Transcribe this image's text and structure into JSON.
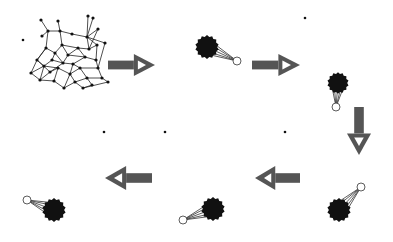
{
  "diagram": {
    "type": "process-flow",
    "colors": {
      "background": "#ffffff",
      "node": "#111111",
      "edge": "#222222",
      "arrow": "#555555",
      "arrow_inner": "#ffffff",
      "highlight_node_fill": "#ffffff",
      "highlight_node_stroke": "#333333"
    },
    "flow_order": [
      "network",
      "arrow-right-1",
      "stage-1",
      "arrow-right-2",
      "stage-2",
      "arrow-down",
      "stage-3",
      "arrow-left-1",
      "stage-4",
      "arrow-left-2",
      "stage-5"
    ],
    "stages": [
      {
        "id": "stage-1",
        "cluster": {
          "cx": 207,
          "cy": 47,
          "r": 11
        },
        "outlier": {
          "cx": 237,
          "cy": 61,
          "r": 4
        }
      },
      {
        "id": "stage-2",
        "cluster": {
          "cx": 338,
          "cy": 83,
          "r": 10
        },
        "outlier": {
          "cx": 336,
          "cy": 107,
          "r": 4
        }
      },
      {
        "id": "stage-3",
        "cluster": {
          "cx": 339,
          "cy": 210,
          "r": 11
        },
        "outlier": {
          "cx": 361,
          "cy": 187,
          "r": 4
        }
      },
      {
        "id": "stage-4",
        "cluster": {
          "cx": 213,
          "cy": 209,
          "r": 11
        },
        "outlier": {
          "cx": 183,
          "cy": 220,
          "r": 4
        }
      },
      {
        "id": "stage-5",
        "cluster": {
          "cx": 54,
          "cy": 210,
          "r": 11
        },
        "outlier": {
          "cx": 27,
          "cy": 200,
          "r": 4
        }
      }
    ],
    "arrows": [
      {
        "id": "arrow-right-1",
        "direction": "right",
        "x": 108,
        "y": 54,
        "w": 47,
        "h": 22
      },
      {
        "id": "arrow-right-2",
        "direction": "right",
        "x": 252,
        "y": 54,
        "w": 48,
        "h": 22
      },
      {
        "id": "arrow-down",
        "direction": "down",
        "x": 347,
        "y": 107,
        "w": 24,
        "h": 48
      },
      {
        "id": "arrow-left-1",
        "direction": "left",
        "x": 255,
        "y": 166,
        "w": 45,
        "h": 24
      },
      {
        "id": "arrow-left-2",
        "direction": "left",
        "x": 105,
        "y": 166,
        "w": 47,
        "h": 24
      }
    ],
    "isolated_dots": [
      {
        "cx": 23,
        "cy": 40
      },
      {
        "cx": 305,
        "cy": 18
      },
      {
        "cx": 104,
        "cy": 132
      },
      {
        "cx": 165,
        "cy": 132
      },
      {
        "cx": 285,
        "cy": 132
      }
    ],
    "network": {
      "nodes": [
        [
          41,
          20
        ],
        [
          58,
          21
        ],
        [
          88,
          16
        ],
        [
          93,
          18
        ],
        [
          98,
          29
        ],
        [
          42,
          36
        ],
        [
          48,
          31
        ],
        [
          60,
          31
        ],
        [
          72,
          34
        ],
        [
          87,
          37
        ],
        [
          105,
          43
        ],
        [
          97,
          45
        ],
        [
          37,
          60
        ],
        [
          31,
          73
        ],
        [
          40,
          80
        ],
        [
          50,
          72
        ],
        [
          63,
          63
        ],
        [
          73,
          64
        ],
        [
          85,
          57
        ],
        [
          96,
          60
        ],
        [
          98,
          68
        ],
        [
          102,
          78
        ],
        [
          108,
          82
        ],
        [
          55,
          53
        ],
        [
          46,
          48
        ],
        [
          62,
          45
        ],
        [
          78,
          48
        ],
        [
          89,
          49
        ],
        [
          54,
          81
        ],
        [
          64,
          88
        ],
        [
          75,
          82
        ],
        [
          87,
          78
        ],
        [
          92,
          85
        ],
        [
          83,
          88
        ],
        [
          70,
          74
        ],
        [
          58,
          68
        ],
        [
          44,
          66
        ],
        [
          52,
          60
        ],
        [
          80,
          68
        ],
        [
          68,
          55
        ]
      ],
      "edges": [
        [
          0,
          6
        ],
        [
          1,
          7
        ],
        [
          6,
          7
        ],
        [
          7,
          8
        ],
        [
          8,
          9
        ],
        [
          2,
          9
        ],
        [
          3,
          9
        ],
        [
          4,
          9
        ],
        [
          9,
          10
        ],
        [
          9,
          11
        ],
        [
          5,
          6
        ],
        [
          6,
          24
        ],
        [
          7,
          25
        ],
        [
          24,
          23
        ],
        [
          23,
          25
        ],
        [
          25,
          26
        ],
        [
          26,
          27
        ],
        [
          27,
          9
        ],
        [
          27,
          11
        ],
        [
          11,
          19
        ],
        [
          19,
          20
        ],
        [
          20,
          21
        ],
        [
          21,
          22
        ],
        [
          18,
          19
        ],
        [
          18,
          26
        ],
        [
          17,
          18
        ],
        [
          16,
          17
        ],
        [
          16,
          23
        ],
        [
          15,
          16
        ],
        [
          12,
          15
        ],
        [
          12,
          13
        ],
        [
          13,
          14
        ],
        [
          14,
          15
        ],
        [
          14,
          28
        ],
        [
          28,
          29
        ],
        [
          29,
          30
        ],
        [
          30,
          31
        ],
        [
          31,
          32
        ],
        [
          32,
          33
        ],
        [
          33,
          30
        ],
        [
          31,
          21
        ],
        [
          30,
          34
        ],
        [
          34,
          17
        ],
        [
          34,
          35
        ],
        [
          35,
          36
        ],
        [
          36,
          37
        ],
        [
          37,
          16
        ],
        [
          37,
          23
        ],
        [
          12,
          24
        ],
        [
          36,
          14
        ],
        [
          38,
          17
        ],
        [
          38,
          20
        ],
        [
          38,
          31
        ],
        [
          39,
          18
        ],
        [
          39,
          16
        ],
        [
          39,
          25
        ],
        [
          35,
          28
        ],
        [
          33,
          22
        ],
        [
          36,
          12
        ],
        [
          4,
          27
        ],
        [
          26,
          39
        ],
        [
          13,
          36
        ],
        [
          29,
          34
        ],
        [
          10,
          20
        ],
        [
          24,
          12
        ],
        [
          38,
          34
        ],
        [
          15,
          35
        ],
        [
          40,
          0
        ]
      ]
    }
  }
}
